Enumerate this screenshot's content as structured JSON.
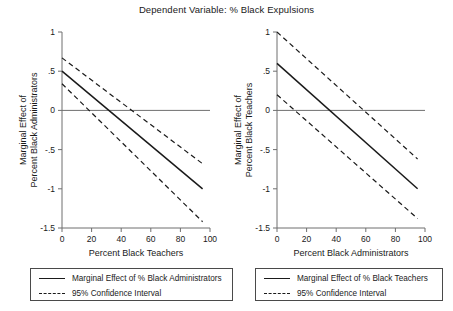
{
  "figure": {
    "title": "Dependent Variable: % Black Expulsions"
  },
  "chart_data": [
    {
      "type": "line",
      "panel": "left",
      "title": "Dependent Variable: % Black Expulsions",
      "xlabel": "Percent Black Teachers",
      "ylabel": "Marginal Effect of Percent Black Administrators",
      "ylabel_line1": "Marginal Effect of",
      "ylabel_line2": "Percent Black Administrators",
      "xlim": [
        0,
        100
      ],
      "ylim": [
        -1.5,
        1
      ],
      "xticks": [
        0,
        20,
        40,
        60,
        80,
        100
      ],
      "xticklabels": [
        "0",
        "20",
        "40",
        "60",
        "80",
        "100"
      ],
      "yticks": [
        1,
        0.5,
        0,
        -0.5,
        -1,
        -1.5
      ],
      "yticklabels": [
        "1",
        ".5",
        "0",
        "-.5",
        "-1",
        "-1.5"
      ],
      "grid": false,
      "zero_line": 0,
      "x": [
        0,
        95
      ],
      "series": [
        {
          "name": "Marginal Effect of % Black Administrators",
          "style": "solid",
          "values": [
            0.5,
            -1.0
          ]
        },
        {
          "name": "95% Confidence Interval Upper",
          "style": "dashed",
          "values": [
            0.67,
            -0.68
          ]
        },
        {
          "name": "95% Confidence Interval Lower",
          "style": "dashed",
          "values": [
            0.34,
            -1.42
          ]
        }
      ],
      "legend": {
        "position": "below",
        "entries": [
          {
            "label": "Marginal Effect of % Black Administrators",
            "style": "solid"
          },
          {
            "label": "95% Confidence Interval",
            "style": "dashed"
          }
        ]
      }
    },
    {
      "type": "line",
      "panel": "right",
      "title": "Dependent Variable: % Black Expulsions",
      "xlabel": "Percent Black Administrators",
      "ylabel": "Marginal Effect of Percent Black Teachers",
      "ylabel_line1": "Marginal Effect of",
      "ylabel_line2": "Percent Black Teachers",
      "xlim": [
        0,
        100
      ],
      "ylim": [
        -1.5,
        1
      ],
      "xticks": [
        0,
        20,
        40,
        60,
        80,
        100
      ],
      "xticklabels": [
        "0",
        "20",
        "40",
        "60",
        "80",
        "100"
      ],
      "yticks": [
        1,
        0.5,
        0,
        -0.5,
        -1,
        -1.5
      ],
      "yticklabels": [
        "1",
        ".5",
        "0",
        "-.5",
        "-1",
        "-1.5"
      ],
      "grid": false,
      "zero_line": 0,
      "x": [
        0,
        95
      ],
      "series": [
        {
          "name": "Marginal Effect of % Black Teachers",
          "style": "solid",
          "values": [
            0.6,
            -1.0
          ]
        },
        {
          "name": "95% Confidence Interval Upper",
          "style": "dashed",
          "values": [
            1.0,
            -0.62
          ]
        },
        {
          "name": "95% Confidence Interval Lower",
          "style": "dashed",
          "values": [
            0.2,
            -1.38
          ]
        }
      ],
      "legend": {
        "position": "below",
        "entries": [
          {
            "label": "Marginal Effect of % Black Teachers",
            "style": "solid"
          },
          {
            "label": "95% Confidence Interval",
            "style": "dashed"
          }
        ]
      }
    }
  ],
  "colors": {
    "line": "#1a1a1a",
    "axis": "#6f6f6f",
    "background": "#ffffff"
  }
}
